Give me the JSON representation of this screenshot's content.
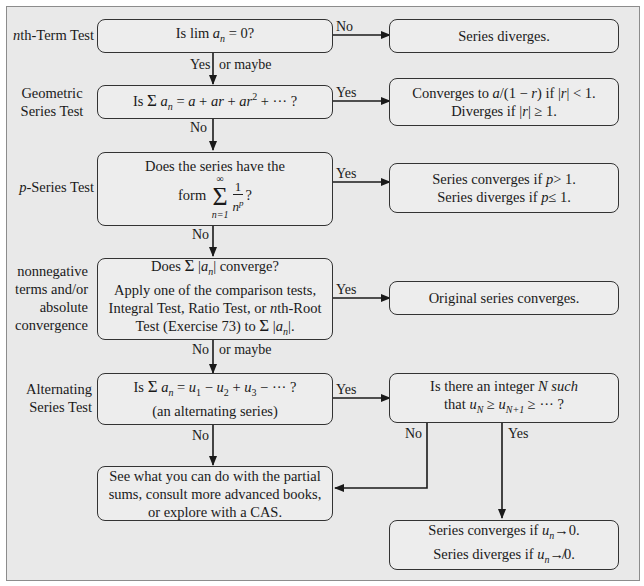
{
  "tests": {
    "nth_term": {
      "label": "nth-Term Test",
      "question": "Is lim aₙ = 0?",
      "no_label": "No",
      "no_result": "Series diverges.",
      "yes_label": "Yes",
      "yes_extra": "or maybe"
    },
    "geometric": {
      "label_line1": "Geometric",
      "label_line2": "Series Test",
      "question": "Is Σ aₙ = a + ar + ar² + ··· ?",
      "yes_label": "Yes",
      "yes_result_line1": "Converges to a/(1 − r) if |r| < 1.",
      "yes_result_line2": "Diverges if |r| ≥ 1.",
      "no_label": "No"
    },
    "p_series": {
      "label": "p-Series Test",
      "question_line1": "Does the series have the",
      "question_line2_prefix": "form",
      "sum_upper": "∞",
      "sum_lower": "n=1",
      "frac_num": "1",
      "frac_den": "nᵖ",
      "question_suffix": "?",
      "yes_label": "Yes",
      "yes_result_line1": "Series converges if p > 1.",
      "yes_result_line2": "Series diverges if p ≤ 1.",
      "no_label": "No"
    },
    "absolute": {
      "label_line1": "nonnegative",
      "label_line2": "terms and/or",
      "label_line3": "absolute",
      "label_line4": "convergence",
      "question_line1": "Does Σ |aₙ| converge?",
      "question_line2": "Apply one of the comparison tests,",
      "question_line3": "Integral Test, Ratio Test, or nth-Root",
      "question_line4": "Test (Exercise 73) to Σ |aₙ|.",
      "yes_label": "Yes",
      "yes_result": "Original series converges.",
      "no_label": "No",
      "no_extra": "or maybe"
    },
    "alternating": {
      "label_line1": "Alternating",
      "label_line2": "Series Test",
      "question_line1": "Is Σ aₙ = u₁ − u₂ + u₃ − ··· ?",
      "question_line2": "(an alternating series)",
      "yes_label": "Yes",
      "followup_line1": "Is there an integer N such",
      "followup_line2": "that u_N ≥ u_{N+1} ≥ ··· ?",
      "followup_no_label": "No",
      "followup_yes_label": "Yes",
      "no_label": "No",
      "final_line1": "Series converges if uₙ→0.",
      "final_line2": "Series diverges if uₙ↛0."
    },
    "fallback": {
      "line1": "See what you can do with the partial",
      "line2": "sums, consult more advanced books,",
      "line3": "or explore with a CAS."
    }
  },
  "colors": {
    "background": "#e9e9e9",
    "box_fill": "#ededed",
    "stroke": "#333333",
    "text": "#1a1a1a"
  }
}
